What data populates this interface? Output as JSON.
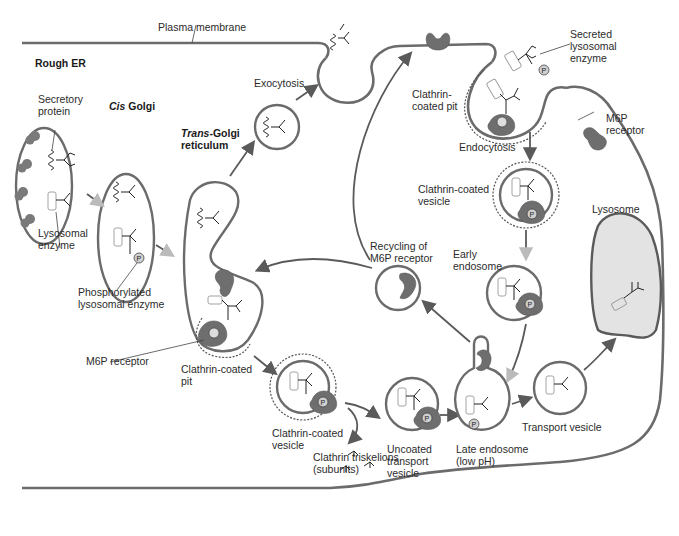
{
  "diagram": {
    "type": "cell-biology-pathway",
    "topic": "Lysosomal enzyme sorting via M6P receptor",
    "labels": {
      "plasma_membrane": "Plasma membrane",
      "rough_er": "Rough ER",
      "secretory_protein": "Secretory\nprotein",
      "cis_golgi_italic": "Cis",
      "cis_golgi_rest": " Golgi",
      "trans_golgi_italic": "Trans",
      "trans_golgi_rest": "-Golgi\nreticulum",
      "lysosomal_enzyme": "Lysosomal\nenzyme",
      "phosphorylated_enzyme": "Phosphorylated\nlysosomal enzyme",
      "m6p_receptor_left": "M6P receptor",
      "clathrin_pit_left": "Clathrin-coated\npit",
      "clathrin_vesicle_left": "Clathrin-coated\nvesicle",
      "clathrin_triskelions": "Clathrin triskelions\n(subunits)",
      "uncoated_vesicle": "Uncoated\ntransport\nvesicle",
      "late_endosome": "Late endosome\n(low pH)",
      "transport_vesicle": "Transport vesicle",
      "lysosome": "Lysosome",
      "exocytosis": "Exocytosis",
      "recycling": "Recycling of\nM6P receptor",
      "clathrin_pit_right": "Clathrin-\ncoated pit",
      "endocytosis": "Endocytosis",
      "secreted_enzyme": "Secreted\nlysosomal\nenzyme",
      "m6p_receptor_right": "M6P\nreceptor",
      "clathrin_vesicle_right": "Clathrin-coated\nvesicle",
      "early_endosome": "Early\nendosome",
      "phosphate_symbol": "P"
    },
    "colors": {
      "membrane": "#6b6b6b",
      "receptor": "#6e6e6e",
      "lysosome_fill": "#e3e3e3",
      "text": "#2b2b2b"
    }
  }
}
